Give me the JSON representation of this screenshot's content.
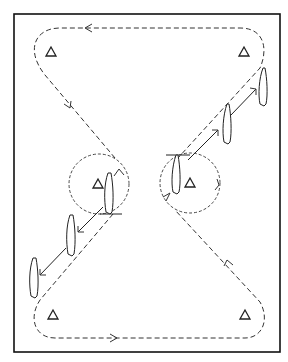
{
  "diagram": {
    "title": "",
    "cones": [
      {
        "id": "top-left"
      },
      {
        "id": "top-right"
      },
      {
        "id": "center-left"
      },
      {
        "id": "center-right"
      },
      {
        "id": "bottom-left"
      },
      {
        "id": "bottom-right"
      }
    ],
    "skaters": [
      {
        "group": "upper-right",
        "count": 3
      },
      {
        "group": "lower-left",
        "count": 3
      }
    ],
    "colors": {
      "line": "#222222",
      "background": "#ffffff"
    }
  }
}
